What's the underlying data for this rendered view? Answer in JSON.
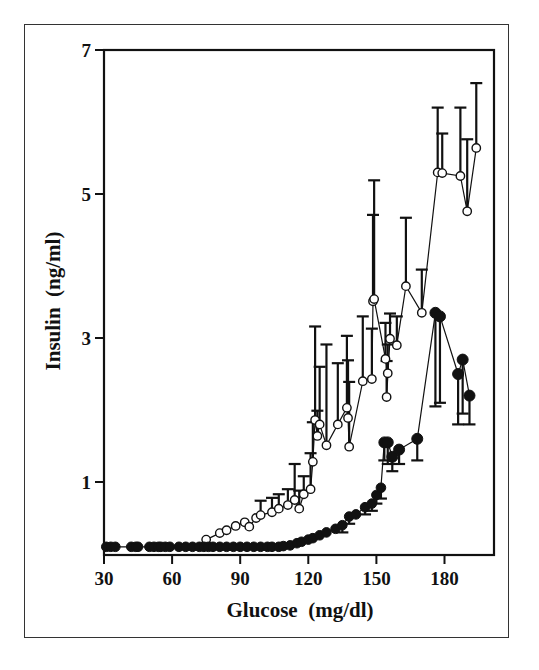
{
  "chart_data": {
    "type": "scatter",
    "title": "",
    "xlabel": "Glucose  (mg/dl)",
    "ylabel": "Insulin  (ng/ml)",
    "xlim": [
      30,
      201
    ],
    "ylim": [
      0,
      7
    ],
    "x_ticks": [
      30,
      60,
      90,
      120,
      150,
      180
    ],
    "y_ticks": [
      1,
      3,
      5,
      7
    ],
    "grid": false,
    "legend": null,
    "series": [
      {
        "name": "open-circles",
        "marker": "open-circle",
        "connected": true,
        "points": [
          {
            "x": 75,
            "y": 0.2
          },
          {
            "x": 81,
            "y": 0.29
          },
          {
            "x": 84,
            "y": 0.33
          },
          {
            "x": 88,
            "y": 0.39
          },
          {
            "x": 92,
            "y": 0.44
          },
          {
            "x": 94,
            "y": 0.38
          },
          {
            "x": 97,
            "y": 0.5
          },
          {
            "x": 99,
            "y": 0.54,
            "err": 0.2
          },
          {
            "x": 104,
            "y": 0.58,
            "err": 0.2
          },
          {
            "x": 107,
            "y": 0.63,
            "err": 0.2
          },
          {
            "x": 111,
            "y": 0.68,
            "err": 0.22
          },
          {
            "x": 114,
            "y": 0.75,
            "err": 0.5
          },
          {
            "x": 116,
            "y": 0.63,
            "err": 0.25
          },
          {
            "x": 118,
            "y": 0.83,
            "err": 0.25
          },
          {
            "x": 121,
            "y": 0.9,
            "err": 0.5
          },
          {
            "x": 122,
            "y": 1.28,
            "err": 0.55
          },
          {
            "x": 123,
            "y": 1.86,
            "err": 1.3
          },
          {
            "x": 124,
            "y": 1.64,
            "err": 0.35
          },
          {
            "x": 125,
            "y": 1.8,
            "err": 0.8
          },
          {
            "x": 128,
            "y": 1.51,
            "err": 1.4
          },
          {
            "x": 133,
            "y": 1.8,
            "err": 0.85
          },
          {
            "x": 137,
            "y": 2.03,
            "err": 1.0
          },
          {
            "x": 137.5,
            "y": 1.89,
            "err": 0.8
          },
          {
            "x": 138,
            "y": 1.49,
            "err": 0.9
          },
          {
            "x": 144,
            "y": 2.4,
            "err": 0.9
          },
          {
            "x": 148,
            "y": 2.43,
            "err": 0.7
          },
          {
            "x": 148.5,
            "y": 3.51,
            "err": 1.2
          },
          {
            "x": 149,
            "y": 3.54,
            "err": 1.65
          },
          {
            "x": 154,
            "y": 2.71,
            "err": 0.5
          },
          {
            "x": 155,
            "y": 2.51,
            "err": 0.4
          },
          {
            "x": 154.5,
            "y": 2.18,
            "err": 0.5
          },
          {
            "x": 156,
            "y": 2.99,
            "err": 0.35
          },
          {
            "x": 159,
            "y": 2.9,
            "err": 0.4
          },
          {
            "x": 163,
            "y": 3.72,
            "err": 0.95
          },
          {
            "x": 170,
            "y": 3.35,
            "err": 0.6
          },
          {
            "x": 177,
            "y": 5.3,
            "err": 0.9
          },
          {
            "x": 179,
            "y": 5.29,
            "err": 0.55
          },
          {
            "x": 187,
            "y": 5.25,
            "err": 0.95
          },
          {
            "x": 190,
            "y": 4.76,
            "err": 1.0
          },
          {
            "x": 194,
            "y": 5.64,
            "err": 0.9
          }
        ]
      },
      {
        "name": "filled-circles",
        "marker": "filled-circle",
        "connected": true,
        "points": [
          {
            "x": 31,
            "y": 0.1
          },
          {
            "x": 33,
            "y": 0.1
          },
          {
            "x": 35,
            "y": 0.1
          },
          {
            "x": 42,
            "y": 0.1
          },
          {
            "x": 44,
            "y": 0.1
          },
          {
            "x": 45,
            "y": 0.1
          },
          {
            "x": 50,
            "y": 0.1
          },
          {
            "x": 52,
            "y": 0.1
          },
          {
            "x": 54,
            "y": 0.1
          },
          {
            "x": 55,
            "y": 0.1
          },
          {
            "x": 57,
            "y": 0.1
          },
          {
            "x": 59,
            "y": 0.1
          },
          {
            "x": 63,
            "y": 0.1
          },
          {
            "x": 66,
            "y": 0.1
          },
          {
            "x": 69,
            "y": 0.1
          },
          {
            "x": 72,
            "y": 0.1
          },
          {
            "x": 74,
            "y": 0.1
          },
          {
            "x": 76,
            "y": 0.1
          },
          {
            "x": 78,
            "y": 0.1
          },
          {
            "x": 81,
            "y": 0.1
          },
          {
            "x": 84,
            "y": 0.1
          },
          {
            "x": 87,
            "y": 0.1
          },
          {
            "x": 90,
            "y": 0.1
          },
          {
            "x": 93,
            "y": 0.1
          },
          {
            "x": 96,
            "y": 0.1
          },
          {
            "x": 99,
            "y": 0.1
          },
          {
            "x": 102,
            "y": 0.1
          },
          {
            "x": 104,
            "y": 0.1
          },
          {
            "x": 107,
            "y": 0.1
          },
          {
            "x": 109,
            "y": 0.11
          },
          {
            "x": 112,
            "y": 0.12
          },
          {
            "x": 115,
            "y": 0.15
          },
          {
            "x": 117,
            "y": 0.17
          },
          {
            "x": 120,
            "y": 0.2
          },
          {
            "x": 122,
            "y": 0.22
          },
          {
            "x": 125,
            "y": 0.26
          },
          {
            "x": 128,
            "y": 0.3
          },
          {
            "x": 132,
            "y": 0.35
          },
          {
            "x": 135,
            "y": 0.4,
            "err": 0.1
          },
          {
            "x": 138,
            "y": 0.52,
            "err": 0.1
          },
          {
            "x": 141,
            "y": 0.55
          },
          {
            "x": 145,
            "y": 0.65,
            "err": 0.1
          },
          {
            "x": 148,
            "y": 0.7,
            "err": 0.1
          },
          {
            "x": 150,
            "y": 0.82,
            "err": 0.12
          },
          {
            "x": 152,
            "y": 0.92,
            "err": 0.15
          },
          {
            "x": 153.5,
            "y": 1.55,
            "err": 0.25
          },
          {
            "x": 155,
            "y": 1.55,
            "err": 0.3
          },
          {
            "x": 157,
            "y": 1.35,
            "err": 0.2
          },
          {
            "x": 160,
            "y": 1.45,
            "err": 0.2
          },
          {
            "x": 168,
            "y": 1.6,
            "err": 0.3
          },
          {
            "x": 176,
            "y": 3.35,
            "err": 1.3
          },
          {
            "x": 178,
            "y": 3.3,
            "err": 1.2
          },
          {
            "x": 186,
            "y": 2.5,
            "err": 0.7
          },
          {
            "x": 188,
            "y": 2.7,
            "err": 0.75
          },
          {
            "x": 191,
            "y": 2.2,
            "err": 0.4
          }
        ]
      }
    ]
  },
  "axes": {
    "x_label": "Glucose  (mg/dl)",
    "y_label": "Insulin  (ng/ml)",
    "x_tick_labels": [
      "30",
      "60",
      "90",
      "120",
      "150",
      "180"
    ],
    "y_tick_labels": [
      "1",
      "3",
      "5",
      "7"
    ]
  },
  "colors": {
    "ink": "#111111",
    "background": "#ffffff",
    "frame": "#333333"
  }
}
